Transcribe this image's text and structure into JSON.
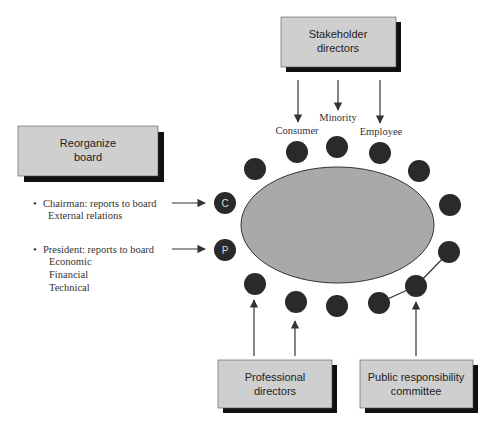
{
  "diagram": {
    "colors": {
      "box_fill": "#cfcfcf",
      "box_shadow": "#111111",
      "table_fill": "#a9a9a9",
      "seat_fill": "#2a2a2a",
      "line": "#333333"
    },
    "boxes": {
      "stakeholder": {
        "line1": "Stakeholder",
        "line2": "directors"
      },
      "reorganize": {
        "line1": "Reorganize",
        "line2": "board"
      },
      "professional": {
        "line1": "Professional",
        "line2": "directors"
      },
      "public": {
        "line1": "Public responsibility",
        "line2": "committee"
      }
    },
    "stakeholder_labels": {
      "consumer": "Consumer",
      "minority": "Minority",
      "employee": "Employee"
    },
    "officers": {
      "chairman": {
        "bullet": "•",
        "title": "Chairman: reports to board",
        "details": [
          "External relations"
        ],
        "seat_label": "C"
      },
      "president": {
        "bullet": "•",
        "title": "President: reports to board",
        "details": [
          "Economic",
          "Financial",
          "Technical"
        ],
        "seat_label": "P"
      }
    },
    "seat_count": 14
  }
}
